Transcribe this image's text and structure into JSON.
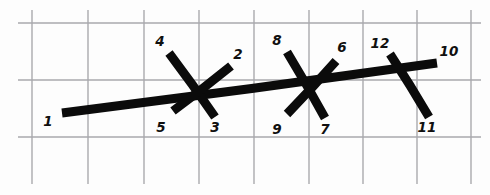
{
  "figure": {
    "background_color": "#fdfdfd",
    "ink_color": "#0b0b0b",
    "grid_color": "#a9a9ad",
    "width": 490,
    "height": 195
  },
  "grid": {
    "vertical_x": [
      32,
      88,
      144,
      199,
      254,
      309,
      363,
      417,
      471
    ],
    "vertical_y_top": 10,
    "vertical_y_bottom": 184,
    "horizontal_y": [
      23,
      80,
      137
    ],
    "horizontal_x_left": 18,
    "horizontal_x_right": 481
  },
  "labels": [
    {
      "text": "1",
      "x": 48,
      "y": 122
    },
    {
      "text": "2",
      "x": 238,
      "y": 55
    },
    {
      "text": "3",
      "x": 215,
      "y": 128
    },
    {
      "text": "4",
      "x": 160,
      "y": 42
    },
    {
      "text": "5",
      "x": 161,
      "y": 128
    },
    {
      "text": "6",
      "x": 342,
      "y": 48
    },
    {
      "text": "7",
      "x": 325,
      "y": 130
    },
    {
      "text": "8",
      "x": 277,
      "y": 41
    },
    {
      "text": "9",
      "x": 277,
      "y": 130
    },
    {
      "text": "10",
      "x": 449,
      "y": 52
    },
    {
      "text": "11",
      "x": 427,
      "y": 128
    },
    {
      "text": "12",
      "x": 380,
      "y": 44
    }
  ],
  "segments": [
    {
      "name": "main-spine-1-to-10",
      "x1": 62,
      "y1": 113,
      "x2": 437,
      "y2": 63,
      "width": 9
    },
    {
      "name": "cross-4-to-3",
      "x1": 169,
      "y1": 53,
      "x2": 215,
      "y2": 117,
      "width": 9
    },
    {
      "name": "branch-5-to-2",
      "x1": 173,
      "y1": 111,
      "x2": 231,
      "y2": 66,
      "width": 9
    },
    {
      "name": "cross-8-to-7",
      "x1": 287,
      "y1": 52,
      "x2": 325,
      "y2": 118,
      "width": 9
    },
    {
      "name": "branch-9-to-6",
      "x1": 287,
      "y1": 114,
      "x2": 336,
      "y2": 61,
      "width": 9
    },
    {
      "name": "cross-12-to-11",
      "x1": 390,
      "y1": 54,
      "x2": 429,
      "y2": 117,
      "width": 9
    }
  ],
  "chart_data": {
    "type": "diagram",
    "node_count": 12,
    "nodes": [
      {
        "id": 1,
        "role": "spine-start",
        "position": "lower-left",
        "x": 62,
        "y": 113
      },
      {
        "id": 2,
        "role": "branch-end-upper",
        "position": "cluster-1",
        "x": 231,
        "y": 66
      },
      {
        "id": 3,
        "role": "cross-end-lower",
        "position": "cluster-1",
        "x": 215,
        "y": 117
      },
      {
        "id": 4,
        "role": "cross-end-upper",
        "position": "cluster-1",
        "x": 169,
        "y": 53
      },
      {
        "id": 5,
        "role": "branch-end-lower",
        "position": "cluster-1",
        "x": 173,
        "y": 111
      },
      {
        "id": 6,
        "role": "branch-end-upper",
        "position": "cluster-2",
        "x": 336,
        "y": 61
      },
      {
        "id": 7,
        "role": "cross-end-lower",
        "position": "cluster-2",
        "x": 325,
        "y": 118
      },
      {
        "id": 8,
        "role": "cross-end-upper",
        "position": "cluster-2",
        "x": 287,
        "y": 52
      },
      {
        "id": 9,
        "role": "branch-end-lower",
        "position": "cluster-2",
        "x": 287,
        "y": 114
      },
      {
        "id": 10,
        "role": "spine-end",
        "position": "upper-right",
        "x": 437,
        "y": 63
      },
      {
        "id": 11,
        "role": "cross-end-lower",
        "position": "cluster-3",
        "x": 429,
        "y": 117
      },
      {
        "id": 12,
        "role": "cross-end-upper",
        "position": "cluster-3",
        "x": 390,
        "y": 54
      }
    ],
    "edges": [
      {
        "from": 1,
        "to": 10
      },
      {
        "from": 4,
        "to": 3
      },
      {
        "from": 5,
        "to": 2
      },
      {
        "from": 8,
        "to": 7
      },
      {
        "from": 9,
        "to": 6
      },
      {
        "from": 12,
        "to": 11
      }
    ],
    "clusters": [
      {
        "name": "cluster-1",
        "labels": [
          4,
          2,
          5,
          3
        ]
      },
      {
        "name": "cluster-2",
        "labels": [
          8,
          6,
          9,
          7
        ]
      },
      {
        "name": "cluster-3",
        "labels": [
          12,
          10,
          11
        ]
      }
    ],
    "grid_columns": 9,
    "grid_rows": 3
  }
}
